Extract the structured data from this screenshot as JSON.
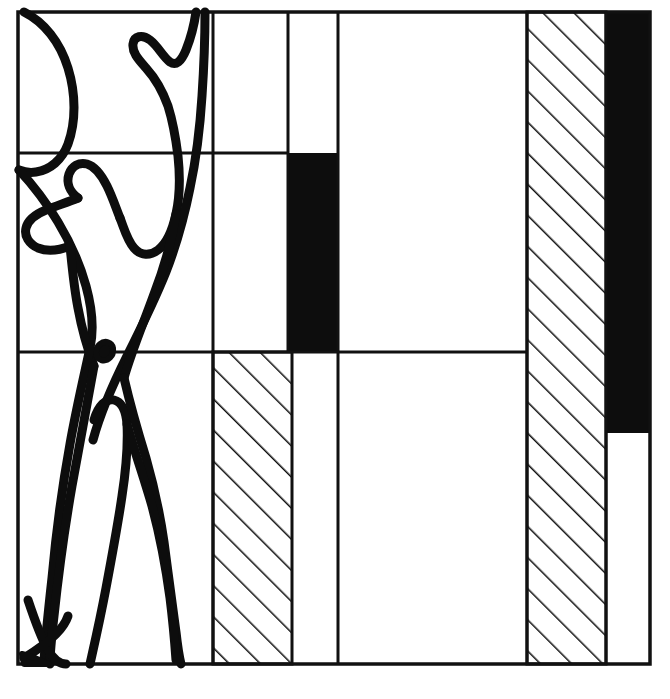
{
  "figure": {
    "canvas": {
      "width": 670,
      "height": 699
    },
    "ink_color": "#0d0d0d",
    "paper_color": "#ffffff",
    "line_color": "#111111"
  },
  "grid": {
    "frame": {
      "left": 18,
      "top": 12,
      "right": 650,
      "bottom": 664
    },
    "vertical_rules": [
      {
        "name": "rule-col-1",
        "x": 213,
        "y_top": 12,
        "y_bottom": 664
      },
      {
        "name": "rule-col-2",
        "x": 288,
        "y_top": 12,
        "y_bottom": 352
      },
      {
        "name": "rule-col-3",
        "x": 338,
        "y_top": 12,
        "y_bottom": 664
      },
      {
        "name": "rule-col-4",
        "x": 527,
        "y_top": 12,
        "y_bottom": 664
      },
      {
        "name": "rule-col-5",
        "x": 606,
        "y_top": 12,
        "y_bottom": 664
      }
    ],
    "horizontal_rules": [
      {
        "name": "rule-upper",
        "y": 153,
        "x_start": 18,
        "x_end": 288
      },
      {
        "name": "rule-middle",
        "y": 352,
        "x_start": 18,
        "x_end": 527
      }
    ]
  },
  "bars": [
    {
      "name": "bar-hatched-lower-inner",
      "fill": "hatch",
      "x": 213,
      "y": 352,
      "width": 79,
      "height": 312,
      "label": "hatched block, lower half, second column"
    },
    {
      "name": "bar-solid-upper-inner",
      "fill": "solid",
      "x": 288,
      "y": 153,
      "width": 50,
      "height": 199,
      "label": "solid black block, upper half, third column"
    },
    {
      "name": "bar-hatched-full-right",
      "fill": "hatch",
      "x": 527,
      "y": 12,
      "width": 79,
      "height": 652,
      "label": "hatched column, full height, right"
    },
    {
      "name": "bar-solid-right",
      "fill": "solid",
      "x": 606,
      "y": 12,
      "width": 44,
      "height": 421,
      "label": "solid black column, right edge"
    }
  ],
  "hatching": {
    "angle_deg": 45,
    "spacing_px": 22,
    "stroke_width_px": 3,
    "direction": "lower-left to upper-right"
  },
  "human_figure": {
    "name": "standing-figure-with-raised-arm",
    "stroke_width_px": 9,
    "description": "Hand-drawn outline of a standing human figure, left arm raised overhead, navel dot at the mid horizontal rule, legs spread to the base line",
    "strokes": [
      {
        "name": "raised-arm-and-torso-right",
        "d": "M 196 12 C 194 26 190 40 186 50 C 181 62 176 66 170 62 C 163 57 158 46 150 40 C 142 34 134 36 133 44 C 132 53 139 60 146 68 C 155 78 163 92 168 106 C 173 122 176 140 178 156 C 180 175 180 196 176 214 C 172 232 166 244 158 250 C 150 256 141 256 134 248 C 127 240 124 228 120 218"
      },
      {
        "name": "arm-outer-and-side",
        "d": "M 205 12 C 205 36 204 66 202 96 C 200 128 196 160 190 188 C 184 218 176 246 166 272 C 154 302 140 330 127 356 C 112 386 100 414 93 440"
      },
      {
        "name": "head-and-shoulder-left",
        "d": "M 120 218 C 116 208 112 196 107 186 C 101 174 94 166 87 164 C 79 162 72 166 69 174 C 66 183 70 192 78 198"
      },
      {
        "name": "shoulder-sweep-left",
        "d": "M 78 198 C 68 202 56 206 46 210 C 36 214 28 220 26 228 C 24 236 29 244 38 248 C 48 252 60 250 70 246"
      },
      {
        "name": "head-arc-upper-left",
        "d": "M 24 12 C 44 22 60 42 68 68 C 76 94 76 122 68 144 C 62 160 50 170 36 172 C 30 173 24 172 19 170"
      },
      {
        "name": "shoulder-to-hip-left",
        "d": "M 19 170 C 32 184 46 202 58 222 C 70 242 80 264 86 286 C 92 308 94 330 90 348"
      },
      {
        "name": "hip-left-diagonal",
        "d": "M 70 246 C 72 266 74 288 78 308 C 82 330 88 350 94 366"
      },
      {
        "name": "torso-midline-right",
        "d": "M 176 214 C 172 240 164 268 154 294 C 144 322 132 350 124 378"
      },
      {
        "name": "navel-dot",
        "d": "M 100 344 C 105 340 112 342 113 348 C 114 356 108 362 101 360 C 95 358 94 349 100 344 Z"
      },
      {
        "name": "pelvis-and-left-leg",
        "d": "M 90 348 C 84 376 76 410 70 444 C 62 488 56 534 52 578 C 48 614 45 644 44 662"
      },
      {
        "name": "left-leg-inner",
        "d": "M 94 366 C 88 400 80 442 72 486 C 64 532 58 578 54 616 C 51 642 50 656 50 664"
      },
      {
        "name": "crotch-peak",
        "d": "M 94 420 C 98 406 106 398 114 400 C 122 402 126 412 127 424 C 128 444 126 470 122 496 C 118 524 112 556 106 588 C 100 620 94 646 90 664"
      },
      {
        "name": "right-leg-outer",
        "d": "M 124 378 C 130 404 138 432 146 458 C 154 486 160 514 164 542 C 168 572 172 604 176 632 C 178 650 180 660 181 664"
      },
      {
        "name": "right-leg-inner",
        "d": "M 127 424 C 134 450 144 478 152 506 C 160 536 166 568 170 598 C 173 622 175 646 176 660"
      },
      {
        "name": "left-foot-wedge",
        "d": "M 28 600 C 34 618 40 636 48 650 C 54 660 60 664 66 664"
      },
      {
        "name": "left-foot-arrow",
        "d": "M 24 658 C 34 652 46 644 56 634 C 62 628 66 622 68 616"
      },
      {
        "name": "foot-sole-mark",
        "d": "M 22 654 C 30 656 40 660 48 664 L 24 664 Z"
      }
    ]
  },
  "annotations": {
    "visible_text": []
  }
}
